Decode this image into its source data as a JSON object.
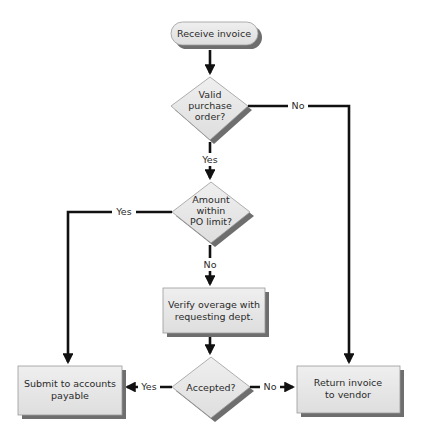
{
  "diagram": {
    "type": "flowchart",
    "colors": {
      "shape_fill": "#e6e6e6",
      "shape_stroke": "#9a9a9a",
      "shadow": "#6e6e6e",
      "line": "#111111",
      "text": "#2a2a2a"
    },
    "nodes": {
      "start": {
        "shape": "terminator",
        "lines": [
          "Receive invoice"
        ]
      },
      "valid_po": {
        "shape": "decision",
        "lines": [
          "Valid",
          "purchase",
          "order?"
        ]
      },
      "within_limit": {
        "shape": "decision",
        "lines": [
          "Amount",
          "within",
          "PO limit?"
        ]
      },
      "verify": {
        "shape": "process",
        "lines": [
          "Verify overage with",
          "requesting dept."
        ]
      },
      "accepted": {
        "shape": "decision",
        "lines": [
          "Accepted?"
        ]
      },
      "submit": {
        "shape": "process",
        "lines": [
          "Submit to accounts",
          "payable"
        ]
      },
      "return": {
        "shape": "process",
        "lines": [
          "Return invoice",
          "to vendor"
        ]
      }
    },
    "edges": [
      {
        "from": "start",
        "to": "valid_po",
        "label": ""
      },
      {
        "from": "valid_po",
        "to": "within_limit",
        "label": "Yes"
      },
      {
        "from": "valid_po",
        "to": "return",
        "label": "No"
      },
      {
        "from": "within_limit",
        "to": "submit",
        "label": "Yes"
      },
      {
        "from": "within_limit",
        "to": "verify",
        "label": "No"
      },
      {
        "from": "verify",
        "to": "accepted",
        "label": ""
      },
      {
        "from": "accepted",
        "to": "submit",
        "label": "Yes"
      },
      {
        "from": "accepted",
        "to": "return",
        "label": "No"
      }
    ],
    "edge_labels": {
      "valid_no": "No",
      "valid_yes": "Yes",
      "limit_yes": "Yes",
      "limit_no": "No",
      "accepted_yes": "Yes",
      "accepted_no": "No"
    }
  }
}
